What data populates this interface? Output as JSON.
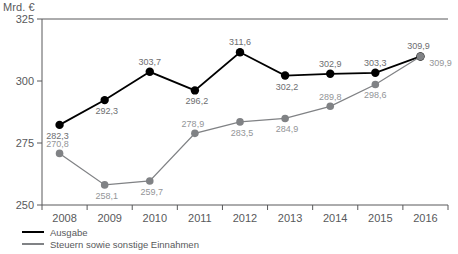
{
  "chart_data": {
    "type": "line",
    "title": "",
    "subtitle": "",
    "xlabel": "",
    "ylabel": "Mrd. €",
    "unit_label": "Mrd. €",
    "categories": [
      "2008",
      "2009",
      "2010",
      "2011",
      "2012",
      "2013",
      "2014",
      "2015",
      "2016"
    ],
    "x": [
      2008,
      2009,
      2010,
      2011,
      2012,
      2013,
      2014,
      2015,
      2016
    ],
    "ylim": [
      250,
      325
    ],
    "yticks": [
      250,
      275,
      300,
      325
    ],
    "ytick_labels": [
      "250",
      "275",
      "300",
      "325"
    ],
    "xtick_labels": [
      "2008",
      "2009",
      "2010",
      "2011",
      "2012",
      "2013",
      "2014",
      "2015",
      "2016"
    ],
    "grid": false,
    "legend_position": "bottom-left",
    "decimal_separator": ",",
    "series": [
      {
        "name": "Ausgabe",
        "color": "#000000",
        "values": [
          282.3,
          292.3,
          303.7,
          296.2,
          311.6,
          302.2,
          302.9,
          303.3,
          309.9
        ],
        "labels": [
          "282,3",
          "292,3",
          "303,7",
          "296,2",
          "311,6",
          "302,2",
          "302,9",
          "303,3",
          "309,9"
        ]
      },
      {
        "name": "Steuern sowie sonstige Einnahmen",
        "color": "#808285",
        "values": [
          270.8,
          258.1,
          259.7,
          278.9,
          283.5,
          284.9,
          289.8,
          298.6,
          309.9
        ],
        "labels": [
          "270,8",
          "258,1",
          "259,7",
          "278,9",
          "283,5",
          "284,9",
          "289,8",
          "298,6",
          "309,9"
        ]
      }
    ]
  },
  "legend": {
    "items": [
      {
        "label": "Ausgabe"
      },
      {
        "label": "Steuern sowie sonstige Einnahmen"
      }
    ]
  }
}
